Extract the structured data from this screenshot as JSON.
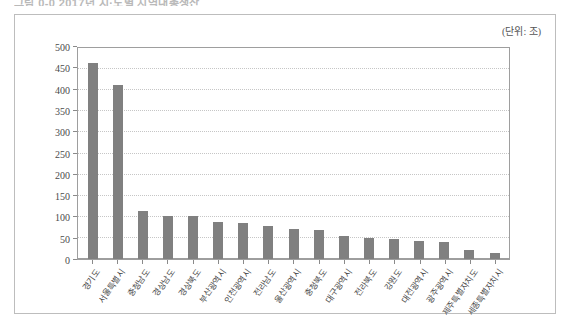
{
  "caption": "그림 0-0  2017년 시·도별 지역내총생산",
  "unit_label": "(단위: 조)",
  "chart_data": {
    "type": "bar",
    "title": "",
    "xlabel": "",
    "ylabel": "",
    "ylim": [
      0,
      500
    ],
    "ytick_step": 50,
    "yticks": [
      "0",
      "50",
      "100",
      "150",
      "200",
      "250",
      "300",
      "350",
      "400",
      "450",
      "500"
    ],
    "grid": true,
    "legend": "none",
    "bar_color": "#808080",
    "categories": [
      "경기도",
      "서울특별시",
      "충청남도",
      "경상남도",
      "경상북도",
      "부산광역시",
      "인천광역시",
      "전라남도",
      "울산광역시",
      "충청북도",
      "대구광역시",
      "전라북도",
      "강원도",
      "대전광역시",
      "광주광역시",
      "제주특별자치도",
      "세종특별자치시"
    ],
    "values": [
      465,
      412,
      113,
      103,
      101,
      87,
      86,
      78,
      70,
      69,
      55,
      50,
      47,
      43,
      41,
      21,
      15
    ]
  }
}
